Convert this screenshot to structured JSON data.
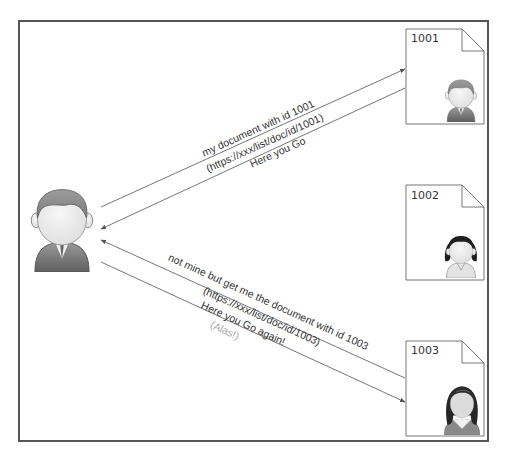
{
  "diagram": {
    "requester": {
      "role": "user",
      "avatar": "male-user-icon"
    },
    "documents": [
      {
        "id": "1001",
        "owner_avatar": "male-user-icon"
      },
      {
        "id": "1002",
        "owner_avatar": "female-user-icon"
      },
      {
        "id": "1003",
        "owner_avatar": "female-user-long-hair-icon"
      }
    ],
    "exchanges": [
      {
        "request_label": "my document with id 1001",
        "url_label": "(https://xxx/list/doc/id/1001)",
        "response_label": "Here you Go"
      },
      {
        "request_label": "not mine but get me the document with id 1003",
        "url_label": "(https://xxx/list/doc/id/1003)",
        "response_label": "Here you Go again!",
        "note_label": "(Alas!)"
      }
    ],
    "colors": {
      "frame": "#555555",
      "line": "#666666",
      "text": "#333333",
      "note": "#aaaaaa",
      "hair_male": "#8c8c8c",
      "hair_female": "#1e1e1e",
      "suit": "#7a7a7a",
      "face": "#eeeeee"
    }
  }
}
